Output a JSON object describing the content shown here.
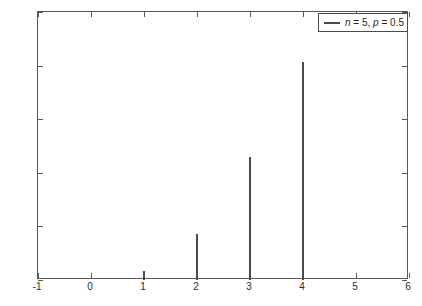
{
  "chart_data": {
    "type": "bar",
    "title": "",
    "xlabel": "",
    "ylabel": "",
    "x": [
      -1,
      0,
      1,
      2,
      3,
      4,
      5,
      6
    ],
    "values": [
      0,
      0,
      0.008,
      0.043,
      0.115,
      0.203,
      0,
      0
    ],
    "series": [
      {
        "name": "n = 5, p = 0.5",
        "x": [
          1,
          2,
          3,
          4
        ],
        "values": [
          0.008,
          0.043,
          0.115,
          0.203
        ]
      }
    ],
    "xlim": [
      -1,
      6
    ],
    "ylim": [
      0,
      0.25
    ],
    "xticks": [
      "-1",
      "0",
      "1",
      "2",
      "3",
      "4",
      "5",
      "6"
    ],
    "xtick_values": [
      -1,
      0,
      1,
      2,
      3,
      4,
      5,
      6
    ],
    "yticks": [
      "0",
      "0.05",
      "0.1",
      "0.15",
      "0.2",
      "0.25"
    ],
    "ytick_values": [
      0,
      0.05,
      0.1,
      0.15,
      0.2,
      0.25
    ],
    "grid": false,
    "legend_position": "top-right",
    "legend": [
      "n = 5, p = 0.5"
    ],
    "line_color": "#4a4a4a",
    "axis_color": "#585858",
    "background_color": "#ffffff"
  },
  "legend": {
    "entry_prefix_n": "n",
    "entry_mid": " = 5, ",
    "entry_prefix_p": "p",
    "entry_suffix": " = 0.5",
    "full_text": "n = 5, p = 0.5"
  }
}
